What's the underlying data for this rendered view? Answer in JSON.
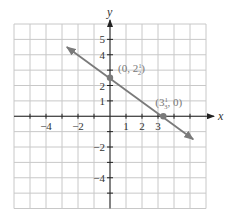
{
  "chart_data": {
    "type": "line",
    "title": "",
    "xlabel": "x",
    "ylabel": "y",
    "xlim": [
      -6,
      6
    ],
    "ylim": [
      -6,
      6
    ],
    "grid": true,
    "x_tick_labels": [
      {
        "value": -4,
        "label": "−4"
      },
      {
        "value": -2,
        "label": "−2"
      },
      {
        "value": 1,
        "label": "1"
      },
      {
        "value": 2,
        "label": "2"
      },
      {
        "value": 3,
        "label": "3"
      }
    ],
    "y_tick_labels": [
      {
        "value": 5,
        "label": "5"
      },
      {
        "value": 4,
        "label": "4"
      },
      {
        "value": 2,
        "label": "2"
      },
      {
        "value": 1,
        "label": "1"
      },
      {
        "value": -2,
        "label": "−2"
      },
      {
        "value": -4,
        "label": "−4"
      }
    ],
    "series": [
      {
        "name": "line",
        "color": "#7a7a7a",
        "start": [
          -2.7,
          4.5
        ],
        "end": [
          5.2,
          -1.5
        ],
        "arrows": "both"
      }
    ],
    "points": [
      {
        "x": 0,
        "y": 2.5,
        "label_whole": "0, 2",
        "label_num": "1",
        "label_den": "2",
        "label_text": "(0, 2½)"
      },
      {
        "x": 3.3333,
        "y": 0,
        "label_whole": "3",
        "label_num": "1",
        "label_den": "3",
        "label_text": "(3⅓, 0)"
      }
    ],
    "colors": {
      "grid": "#c8c8c8",
      "axis": "#222222",
      "line": "#7a7a7a",
      "point": "#7a7a7a",
      "point_label": "#7a7a7a"
    }
  }
}
